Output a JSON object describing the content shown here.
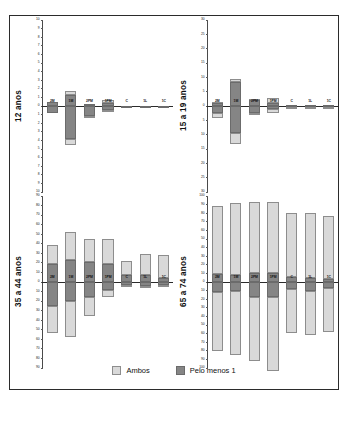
{
  "figure": {
    "legend": {
      "items": [
        {
          "label": "Ambos",
          "color": "#d9d9d9",
          "key": "ambos"
        },
        {
          "label": "Pelo menos 1",
          "color": "#858585",
          "key": "pelo"
        }
      ]
    }
  },
  "chart_data": [
    {
      "type": "bar",
      "panel_id": "top-left",
      "title": "12 anos",
      "xlabel": "",
      "ylabel": "",
      "ylim": [
        -10,
        10
      ],
      "yticks": [
        10,
        9,
        8,
        7,
        6,
        5,
        4,
        3,
        2,
        1,
        0,
        1,
        2,
        3,
        4,
        5,
        6,
        7,
        8,
        9,
        10
      ],
      "grid": false,
      "legend_position": "bottom",
      "categories": [
        "2M",
        "1M",
        "2PM",
        "1PM",
        "C",
        "1L",
        "1C"
      ],
      "series": [
        {
          "name": "Pelo menos 1",
          "values_positive": [
            0.45,
            1.25,
            0.2,
            0.35,
            0.05,
            0.05,
            0.05
          ],
          "values_negative": [
            -0.8,
            -3.8,
            -1.2,
            -0.5,
            -0.1,
            -0.1,
            -0.1
          ]
        },
        {
          "name": "Ambos",
          "values_positive": [
            0.0,
            0.45,
            0.05,
            0.35,
            0.0,
            0.0,
            0.0
          ],
          "values_negative": [
            0.0,
            -0.7,
            -0.15,
            -0.15,
            0.0,
            0.0,
            0.0
          ]
        }
      ]
    },
    {
      "type": "bar",
      "panel_id": "top-right",
      "title": "15 a 19 anos",
      "xlabel": "",
      "ylabel": "",
      "ylim": [
        -30,
        30
      ],
      "yticks": [
        30,
        25,
        20,
        15,
        10,
        5,
        0,
        5,
        10,
        15,
        20,
        25,
        30
      ],
      "grid": false,
      "legend_position": "bottom",
      "categories": [
        "2M",
        "1M",
        "2PM",
        "1PM",
        "C",
        "1L",
        "1C"
      ],
      "series": [
        {
          "name": "Pelo menos 1",
          "values_positive": [
            1.2,
            8.4,
            2.0,
            1.2,
            0.3,
            0.3,
            0.3
          ],
          "values_negative": [
            -2.6,
            -9.5,
            -2.6,
            -1.0,
            -0.2,
            -0.2,
            -0.2
          ]
        },
        {
          "name": "Ambos",
          "values_positive": [
            0.2,
            0.9,
            0.3,
            1.6,
            0.1,
            0.1,
            0.1
          ],
          "values_negative": [
            -1.5,
            -3.9,
            -0.2,
            -1.3,
            -0.2,
            -0.2,
            -0.2
          ]
        }
      ]
    },
    {
      "type": "bar",
      "panel_id": "bottom-left",
      "title": "35 a 44 anos",
      "xlabel": "",
      "ylabel": "",
      "ylim": [
        -90,
        90
      ],
      "yticks": [
        90,
        80,
        70,
        60,
        50,
        40,
        30,
        20,
        10,
        0,
        10,
        20,
        30,
        40,
        50,
        60,
        70,
        80,
        90
      ],
      "grid": false,
      "legend_position": "bottom",
      "categories": [
        "2M",
        "1M",
        "2PM",
        "1PM",
        "C",
        "1L",
        "1C"
      ],
      "series": [
        {
          "name": "Pelo menos 1",
          "values_positive": [
            19,
            23,
            21,
            19,
            7,
            7,
            4
          ],
          "values_negative": [
            -25,
            -20,
            -16,
            -8,
            -3,
            -4,
            -3
          ]
        },
        {
          "name": "Ambos",
          "values_positive": [
            20,
            29,
            24,
            26,
            15,
            22,
            24
          ],
          "values_negative": [
            -28,
            -38,
            -20,
            -8,
            -1,
            -1,
            -1
          ]
        }
      ]
    },
    {
      "type": "bar",
      "panel_id": "bottom-right",
      "title": "65 a 74 anos",
      "xlabel": "",
      "ylabel": "",
      "ylim": [
        -100,
        100
      ],
      "yticks": [
        100,
        90,
        80,
        70,
        60,
        50,
        40,
        30,
        20,
        10,
        0,
        10,
        20,
        30,
        40,
        50,
        60,
        70,
        80,
        90,
        100
      ],
      "grid": false,
      "legend_position": "bottom",
      "categories": [
        "2M",
        "1M",
        "2PM",
        "1PM",
        "C",
        "1L",
        "1C"
      ],
      "series": [
        {
          "name": "Pelo menos 1",
          "values_positive": [
            9,
            8,
            10,
            11,
            6,
            5,
            4
          ],
          "values_negative": [
            -12,
            -11,
            -17,
            -18,
            -8,
            -11,
            -7
          ]
        },
        {
          "name": "Ambos",
          "values_positive": [
            79,
            84,
            83,
            82,
            74,
            75,
            73
          ],
          "values_negative": [
            -68,
            -74,
            -75,
            -86,
            -51,
            -51,
            -51
          ]
        }
      ]
    }
  ]
}
